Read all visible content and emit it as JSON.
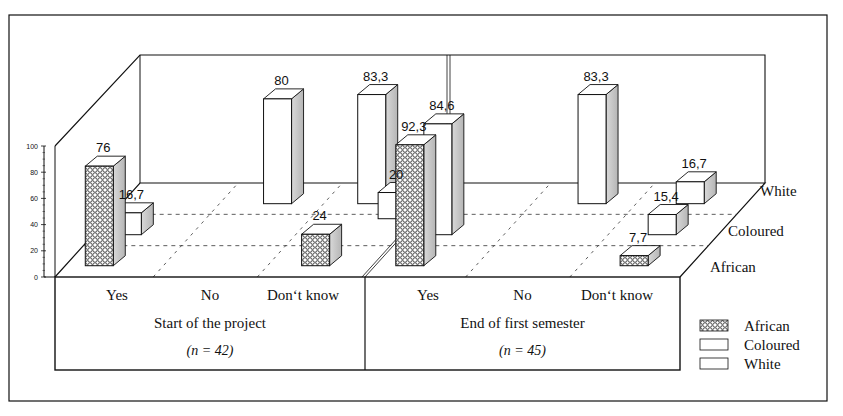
{
  "chart_data": {
    "type": "bar",
    "subtype": "3d-grouped-bar",
    "title": "",
    "xlabel": "",
    "ylabel": "",
    "ylim": [
      0,
      100
    ],
    "yticks": [
      0,
      20,
      40,
      60,
      80,
      100
    ],
    "groups": [
      {
        "label": "Start of the project",
        "n_label": "(n = 42)",
        "categories": [
          "Yes",
          "No",
          "Don't know"
        ]
      },
      {
        "label": "End of first semester",
        "n_label": "(n = 45)",
        "categories": [
          "Yes",
          "No",
          "Don't know"
        ]
      }
    ],
    "categories": [
      "Yes",
      "No",
      "Don't know",
      "Yes",
      "No",
      "Don't know"
    ],
    "category_labels_display": [
      "Yes",
      "No",
      "Don‘t know",
      "Yes",
      "No",
      "Don‘t know"
    ],
    "depth_labels": [
      "White",
      "Coloured",
      "African"
    ],
    "series": [
      {
        "name": "African",
        "pattern": "crosshatch",
        "values": [
          76,
          null,
          24,
          92.3,
          null,
          7.7
        ],
        "labels": [
          "76",
          "",
          "24",
          "92,3",
          "",
          "7,7"
        ]
      },
      {
        "name": "Coloured",
        "pattern": "white",
        "values": [
          16.7,
          null,
          null,
          84.6,
          null,
          15.4
        ],
        "labels": [
          "16,7",
          "",
          "",
          "84,6",
          "",
          "15,4"
        ]
      },
      {
        "name": "White",
        "pattern": "white",
        "values": [
          null,
          80,
          83.3,
          null,
          83.3,
          16.7
        ],
        "labels": [
          "",
          "80",
          "83,3",
          "",
          "83,3",
          "16,7"
        ]
      }
    ],
    "extra_bars": [
      {
        "series": "White",
        "category_index": 2,
        "value": 20,
        "label": "20",
        "note": "small white box behind Don't know (start)"
      }
    ],
    "legend": {
      "position": "bottom-right",
      "entries": [
        "African",
        "Coloured",
        "White"
      ]
    },
    "grid": true,
    "grid_style": "dashed-floor"
  },
  "colors": {
    "line": "#111111",
    "side_shade": "#c8c8c8",
    "face": "#ffffff",
    "hatch": "#222222"
  }
}
